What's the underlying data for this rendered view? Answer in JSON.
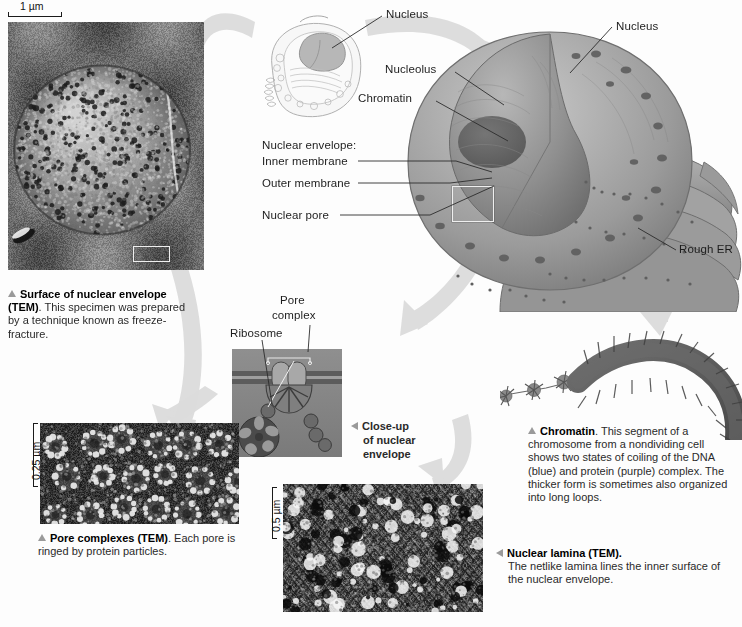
{
  "figure": {
    "background_color": "#fdfdfd",
    "arrow_color": "#dcdcdc"
  },
  "scale_bars": [
    {
      "id": "tem-surface-scale",
      "text": "1 µm",
      "orientation": "horizontal"
    },
    {
      "id": "pore-complexes-scale",
      "text": "0.25 µm",
      "orientation": "vertical"
    },
    {
      "id": "nuclear-lamina-scale",
      "text": "0.5 µm",
      "orientation": "vertical"
    }
  ],
  "labels": {
    "nucleus_cell_inset": "Nucleus",
    "nucleolus": "Nucleolus",
    "chromatin": "Chromatin",
    "nuclear_envelope_group": "Nuclear envelope:",
    "inner_membrane": "Inner membrane",
    "outer_membrane": "Outer membrane",
    "nuclear_pore": "Nuclear pore",
    "nucleus_main": "Nucleus",
    "rough_er": "Rough ER",
    "pore_complex": "Pore\ncomplex",
    "pore_complex_line1": "Pore",
    "pore_complex_line2": "complex",
    "ribosome": "Ribosome"
  },
  "captions": {
    "surface_of_nuclear_envelope": {
      "marker": "triangle-up",
      "bold": "Surface of nuclear envelope (TEM)",
      "body": ". This specimen was prepared by a technique known as freeze-fracture."
    },
    "pore_complexes": {
      "marker": "triangle-up",
      "bold": "Pore complexes (TEM)",
      "body": ". Each pore is ringed by protein particles."
    },
    "close_up_of_nuclear_envelope": {
      "marker": "triangle-left",
      "bold": "Close-up\nof nuclear\nenvelope",
      "line1": "Close-up",
      "line2": "of nuclear",
      "line3": "envelope"
    },
    "nuclear_lamina": {
      "marker": "triangle-left",
      "bold": "Nuclear lamina (TEM).",
      "body": "The netlike lamina lines the inner surface of the nuclear envelope."
    },
    "chromatin": {
      "marker": "triangle-up",
      "bold": "Chromatin",
      "body": ". This segment of a chromosome from a nondividing cell shows two states of coiling of the DNA (blue) and protein (purple) complex. The thicker form is sometimes also organized into long loops."
    }
  },
  "micrographs": [
    {
      "id": "surface-of-nuclear-envelope-tem",
      "name": "Surface of nuclear envelope (TEM)"
    },
    {
      "id": "pore-complexes-tem",
      "name": "Pore complexes (TEM)"
    },
    {
      "id": "close-up-nuclear-envelope-diagram",
      "name": "Close-up of nuclear envelope diagram"
    },
    {
      "id": "nuclear-lamina-tem",
      "name": "Nuclear lamina (TEM)"
    }
  ]
}
